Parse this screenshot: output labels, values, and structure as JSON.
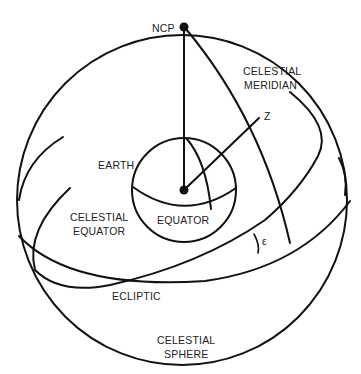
{
  "diagram": {
    "labels": {
      "ncp": "NCP",
      "celestial_meridian_1": "CELESTIAL",
      "celestial_meridian_2": "MERIDIAN",
      "zenith": "Z",
      "earth": "EARTH",
      "celestial_equator_1": "CELESTIAL",
      "celestial_equator_2": "EQUATOR",
      "equator": "EQUATOR",
      "epsilon": "ε",
      "ecliptic": "ECLIPTIC",
      "celestial_sphere_1": "CELESTIAL",
      "celestial_sphere_2": "SPHERE"
    },
    "colors": {
      "line": "#111111",
      "text": "#222222",
      "background": "#ffffff"
    }
  }
}
